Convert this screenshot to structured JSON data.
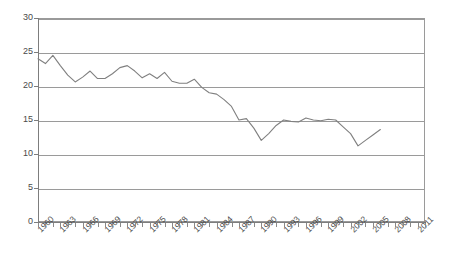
{
  "chart_data": {
    "type": "line",
    "title": "",
    "subtitle": "",
    "xlabel": "",
    "ylabel": "",
    "grid": true,
    "legend": false,
    "legend_position": "none",
    "xlim": [
      1960,
      2012
    ],
    "ylim": [
      0,
      30
    ],
    "y_ticks": [
      0,
      5,
      10,
      15,
      20,
      25,
      30
    ],
    "x_tick_labels": [
      "1960",
      "1963",
      "1966",
      "1969",
      "1972",
      "1975",
      "1978",
      "1981",
      "1984",
      "1987",
      "1990",
      "1993",
      "1996",
      "1999",
      "2002",
      "2005",
      "2008",
      "2011"
    ],
    "x_tick_step": 1,
    "x_label_step": 3,
    "series": [
      {
        "name": "series-1",
        "color": "#808080",
        "x": [
          1960,
          1961,
          1962,
          1963,
          1964,
          1965,
          1966,
          1967,
          1968,
          1969,
          1970,
          1971,
          1972,
          1973,
          1974,
          1975,
          1976,
          1977,
          1978,
          1979,
          1980,
          1981,
          1982,
          1983,
          1984,
          1985,
          1986,
          1987,
          1988,
          1989,
          1990,
          1991,
          1992,
          1993,
          1994,
          1995,
          1996,
          1997,
          1998,
          1999,
          2000,
          2001,
          2002,
          2003,
          2004,
          2005,
          2006
        ],
        "values": [
          24.0,
          23.3,
          24.5,
          23.0,
          21.6,
          20.6,
          21.3,
          22.2,
          21.1,
          21.1,
          21.8,
          22.7,
          23.0,
          22.2,
          21.2,
          21.8,
          21.1,
          22.0,
          20.7,
          20.4,
          20.4,
          21.0,
          19.8,
          19.0,
          18.8,
          18.0,
          17.0,
          15.0,
          15.2,
          13.8,
          12.0,
          13.0,
          14.2,
          15.0,
          14.8,
          14.7,
          15.3,
          15.0,
          14.9,
          15.1,
          15.0,
          14.0,
          13.0,
          11.2,
          12.0,
          12.8,
          13.6
        ]
      }
    ]
  },
  "axes": {
    "y_axis_name": "y-axis",
    "x_axis_name": "x-axis"
  },
  "colors": {
    "series": "#808080",
    "grid": "#9a9a9a",
    "axis": "#7d7d7d",
    "tick_text": "#4a4a4a",
    "background": "#ffffff"
  }
}
